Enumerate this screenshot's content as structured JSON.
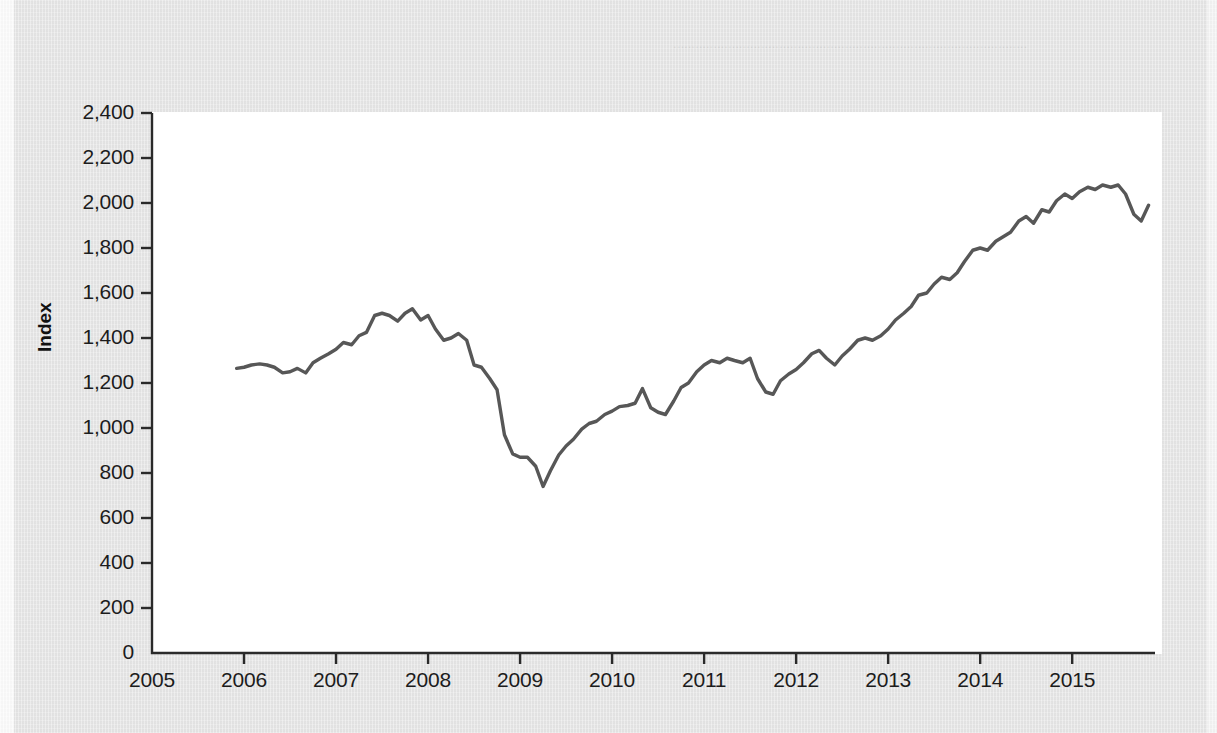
{
  "figure": {
    "y_axis_title": "Index",
    "line_color": "#575757",
    "axis_color": "#2a2a2a",
    "plot_background": "#ffffff",
    "page_background": "#e6e6e6"
  },
  "bleed_text": {
    "note": "faint mirrored show-through from the reverse page",
    "lines": [
      "11-3 Factors That Move Stock Prices",
      "11.3a Earnings Factor"
    ]
  },
  "chart_data": {
    "type": "line",
    "title": "",
    "xlabel": "",
    "ylabel": "Index",
    "xlim": [
      2005,
      2015.9
    ],
    "ylim": [
      0,
      2400
    ],
    "ytick_labels": [
      "0",
      "200",
      "400",
      "600",
      "800",
      "1,000",
      "1,200",
      "1,400",
      "1,600",
      "1,800",
      "2,000",
      "2,200",
      "2,400"
    ],
    "ytick_values": [
      0,
      200,
      400,
      600,
      800,
      1000,
      1200,
      1400,
      1600,
      1800,
      2000,
      2200,
      2400
    ],
    "xtick_labels": [
      "2005",
      "2006",
      "2007",
      "2008",
      "2009",
      "2010",
      "2011",
      "2012",
      "2013",
      "2014",
      "2015"
    ],
    "xtick_values": [
      2005,
      2006,
      2007,
      2008,
      2009,
      2010,
      2011,
      2012,
      2013,
      2014,
      2015
    ],
    "grid": false,
    "legend": "none",
    "series": [
      {
        "name": "Stock price index",
        "x": [
          2005.92,
          2006.0,
          2006.08,
          2006.17,
          2006.25,
          2006.33,
          2006.42,
          2006.5,
          2006.58,
          2006.67,
          2006.75,
          2006.83,
          2006.92,
          2007.0,
          2007.08,
          2007.17,
          2007.25,
          2007.33,
          2007.42,
          2007.5,
          2007.58,
          2007.67,
          2007.75,
          2007.83,
          2007.92,
          2008.0,
          2008.08,
          2008.17,
          2008.25,
          2008.33,
          2008.42,
          2008.5,
          2008.58,
          2008.67,
          2008.75,
          2008.83,
          2008.92,
          2009.0,
          2009.08,
          2009.17,
          2009.25,
          2009.33,
          2009.42,
          2009.5,
          2009.58,
          2009.67,
          2009.75,
          2009.83,
          2009.92,
          2010.0,
          2010.08,
          2010.17,
          2010.25,
          2010.33,
          2010.42,
          2010.5,
          2010.58,
          2010.67,
          2010.75,
          2010.83,
          2010.92,
          2011.0,
          2011.08,
          2011.17,
          2011.25,
          2011.33,
          2011.42,
          2011.5,
          2011.58,
          2011.67,
          2011.75,
          2011.83,
          2011.92,
          2012.0,
          2012.08,
          2012.17,
          2012.25,
          2012.33,
          2012.42,
          2012.5,
          2012.58,
          2012.67,
          2012.75,
          2012.83,
          2012.92,
          2013.0,
          2013.08,
          2013.17,
          2013.25,
          2013.33,
          2013.42,
          2013.5,
          2013.58,
          2013.67,
          2013.75,
          2013.83,
          2013.92,
          2014.0,
          2014.08,
          2014.17,
          2014.25,
          2014.33,
          2014.42,
          2014.5,
          2014.58,
          2014.67,
          2014.75,
          2014.83,
          2014.92,
          2015.0,
          2015.08,
          2015.17,
          2015.25,
          2015.33,
          2015.42,
          2015.5,
          2015.58,
          2015.67,
          2015.75,
          2015.83
        ],
        "y": [
          1265,
          1270,
          1280,
          1285,
          1280,
          1270,
          1245,
          1250,
          1265,
          1245,
          1290,
          1310,
          1330,
          1350,
          1380,
          1370,
          1410,
          1425,
          1500,
          1510,
          1500,
          1475,
          1510,
          1530,
          1480,
          1500,
          1440,
          1390,
          1400,
          1420,
          1390,
          1280,
          1270,
          1220,
          1170,
          970,
          885,
          870,
          870,
          830,
          740,
          810,
          880,
          920,
          950,
          995,
          1020,
          1030,
          1060,
          1075,
          1095,
          1100,
          1110,
          1175,
          1090,
          1070,
          1060,
          1120,
          1180,
          1200,
          1250,
          1280,
          1300,
          1290,
          1310,
          1300,
          1290,
          1310,
          1220,
          1160,
          1150,
          1210,
          1240,
          1260,
          1290,
          1330,
          1345,
          1310,
          1280,
          1320,
          1350,
          1390,
          1400,
          1390,
          1410,
          1440,
          1480,
          1510,
          1540,
          1590,
          1600,
          1640,
          1670,
          1660,
          1690,
          1740,
          1790,
          1800,
          1790,
          1830,
          1850,
          1870,
          1920,
          1940,
          1910,
          1970,
          1960,
          2010,
          2040,
          2020,
          2050,
          2070,
          2060,
          2080,
          2070,
          2080,
          2040,
          1950,
          1920,
          1990
        ]
      }
    ]
  }
}
